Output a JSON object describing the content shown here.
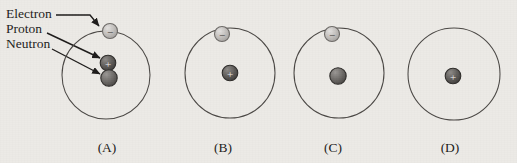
{
  "figure": {
    "background_color": "#eceae6",
    "legend": {
      "items": [
        {
          "label": "Electron",
          "x": 6,
          "y": 18,
          "target_particle": "electron"
        },
        {
          "label": "Proton",
          "x": 6,
          "y": 33,
          "target_particle": "proton"
        },
        {
          "label": "Neutron",
          "x": 6,
          "y": 48,
          "target_particle": "neutron"
        }
      ]
    },
    "particle_styles": {
      "electron": {
        "fill": "#b9b6b3",
        "stroke": "#6d6a67",
        "sign": "−",
        "sign_color": "#3a3836",
        "radius": 7.5
      },
      "proton": {
        "fill": "#5d5a57",
        "stroke": "#2e2c2a",
        "sign": "+",
        "sign_color": "#f0eeec",
        "radius": 7.8
      },
      "neutron": {
        "fill": "#6f6c69",
        "stroke": "#2e2c2a",
        "sign": "",
        "sign_color": "#000000",
        "radius": 8.2
      }
    },
    "panels": [
      {
        "id": "A",
        "label": "(A)",
        "label_x": 107,
        "label_y": 152,
        "orbit": {
          "cx": 106,
          "cy": 75,
          "r": 44
        },
        "particles": [
          {
            "type": "electron",
            "cx": 110,
            "cy": 31
          },
          {
            "type": "proton",
            "cx": 108,
            "cy": 63
          },
          {
            "type": "neutron",
            "cx": 109,
            "cy": 78
          }
        ]
      },
      {
        "id": "B",
        "label": "(B)",
        "label_x": 223,
        "label_y": 152,
        "orbit": {
          "cx": 230,
          "cy": 73,
          "r": 45
        },
        "particles": [
          {
            "type": "electron",
            "cx": 222,
            "cy": 34
          },
          {
            "type": "proton",
            "cx": 230,
            "cy": 73
          }
        ]
      },
      {
        "id": "C",
        "label": "(C)",
        "label_x": 333,
        "label_y": 152,
        "orbit": {
          "cx": 339,
          "cy": 73,
          "r": 45
        },
        "particles": [
          {
            "type": "electron",
            "cx": 332,
            "cy": 34
          },
          {
            "type": "neutron",
            "cx": 338,
            "cy": 76
          }
        ]
      },
      {
        "id": "D",
        "label": "(D)",
        "label_x": 450,
        "label_y": 152,
        "orbit": {
          "cx": 454,
          "cy": 74,
          "r": 46
        },
        "particles": [
          {
            "type": "proton",
            "cx": 453,
            "cy": 76
          }
        ]
      }
    ],
    "leader_lines": [
      {
        "name": "electron-leader",
        "path": "M 56,15 L 90,15 L 99,26",
        "arrow_to": [
          101,
          28
        ]
      },
      {
        "name": "proton-leader",
        "path": "M 47,33 L 100,58",
        "arrow_to": [
          102,
          59
        ]
      },
      {
        "name": "neutron-leader",
        "path": "M 52,49 L 100,74",
        "arrow_to": [
          102,
          75
        ]
      }
    ],
    "answer_labels": [
      "(A)",
      "(B)",
      "(C)",
      "(D)"
    ]
  }
}
